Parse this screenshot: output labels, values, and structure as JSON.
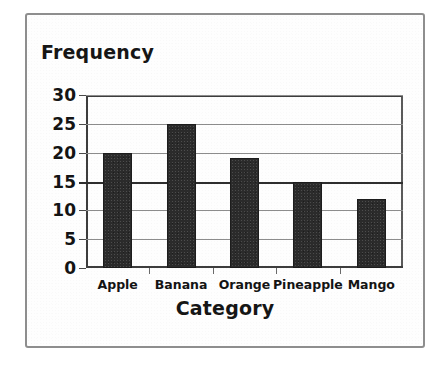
{
  "chart_data": {
    "type": "bar",
    "title": "",
    "xlabel": "Category",
    "ylabel": "Frequency",
    "categories": [
      "Apple",
      "Banana",
      "Orange",
      "Pineapple",
      "Mango"
    ],
    "values": [
      20,
      25,
      19,
      15,
      12
    ],
    "ylim": [
      0,
      30
    ],
    "yticks": [
      0,
      5,
      10,
      15,
      20,
      25,
      30
    ],
    "ytick_labels": [
      "0",
      "5",
      "10",
      "15",
      "20",
      "25",
      "30"
    ],
    "grid": true,
    "emphasized_gridline": 15,
    "legend": null,
    "bar_color": "#2b2b2b",
    "grid_color": "#8d8d8d",
    "axis_color": "#3d3d3d",
    "frame_color": "#8e8e8e",
    "background_color": "#ffffff"
  }
}
